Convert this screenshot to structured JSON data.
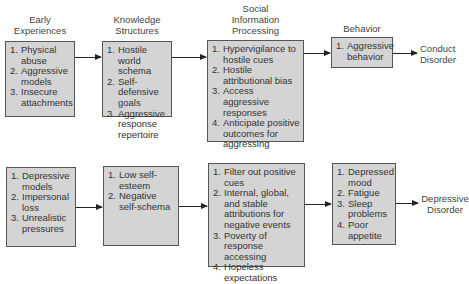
{
  "headers": {
    "early": "Early\nExperiences",
    "knowledge": "Knowledge\nStructures",
    "social": "Social\nInformation\nProcessing",
    "behavior": "Behavior"
  },
  "rows": [
    {
      "boxes": [
        {
          "items": [
            {
              "n": "1.",
              "t": "Physical abuse"
            },
            {
              "n": "2.",
              "t": "Aggressive models"
            },
            {
              "n": "3.",
              "t": "Insecure attachments"
            }
          ]
        },
        {
          "items": [
            {
              "n": "1.",
              "t": "Hostile world schema"
            },
            {
              "n": "2.",
              "t": "Self-defensive goals"
            },
            {
              "n": "3.",
              "t": "Aggressive response repertoire"
            }
          ]
        },
        {
          "items": [
            {
              "n": "1.",
              "t": "Hypervigilance to hostile cues"
            },
            {
              "n": "2.",
              "t": "Hostile attributional bias"
            },
            {
              "n": "3.",
              "t": "Access aggressive responses"
            },
            {
              "n": "4.",
              "t": "Anticipate positive outcomes for aggressing"
            }
          ]
        },
        {
          "items": [
            {
              "n": "1.",
              "t": "Aggressive behavior"
            }
          ]
        }
      ],
      "outcome": "Conduct\nDisorder"
    },
    {
      "boxes": [
        {
          "items": [
            {
              "n": "1.",
              "t": "Depressive models"
            },
            {
              "n": "2.",
              "t": "Impersonal loss"
            },
            {
              "n": "3.",
              "t": "Unrealistic pressures"
            }
          ]
        },
        {
          "items": [
            {
              "n": "1.",
              "t": "Low self-esteem"
            },
            {
              "n": "2.",
              "t": "Negative self-schema"
            }
          ]
        },
        {
          "items": [
            {
              "n": "1.",
              "t": "Filter out positive cues"
            },
            {
              "n": "2.",
              "t": "Internal, global, and stable attributions for negative events"
            },
            {
              "n": "3.",
              "t": "Poverty of response accessing"
            },
            {
              "n": "4.",
              "t": "Hopeless expectations"
            }
          ]
        },
        {
          "items": [
            {
              "n": "1.",
              "t": "Depressed mood"
            },
            {
              "n": "2.",
              "t": "Fatigue"
            },
            {
              "n": "3.",
              "t": "Sleep problems"
            },
            {
              "n": "4.",
              "t": "Poor appetite"
            }
          ]
        }
      ],
      "outcome": "Depressive\nDisorder"
    }
  ],
  "colors": {
    "box_fill": "#d4d4d4",
    "box_border": "#555555",
    "arrow": "#222222"
  }
}
